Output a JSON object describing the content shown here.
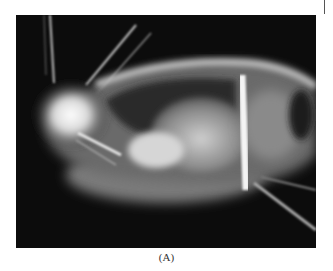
{
  "figure": {
    "caption": "(A)",
    "image_kind": "radiograph-lateral-view",
    "colors": {
      "background": "#0c0c0c",
      "soft_tissue": "#9a9a9a",
      "bone": "#f4f4f4",
      "page": "#ffffff"
    }
  }
}
